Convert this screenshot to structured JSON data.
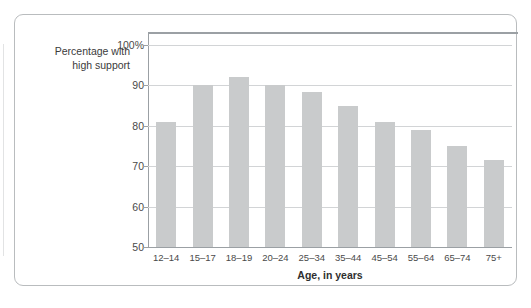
{
  "chart_data": {
    "type": "bar",
    "title": "",
    "subtitle": "",
    "xlabel": "Age, in years",
    "ylabel": "Percentage with high support",
    "ylabel_line1": "Percentage with",
    "ylabel_line2": "high support",
    "categories": [
      "12–14",
      "15–17",
      "18–19",
      "20–24",
      "25–34",
      "35–44",
      "45–54",
      "55–64",
      "65–74",
      "75+"
    ],
    "values": [
      81,
      90,
      92,
      90,
      88.5,
      85,
      81,
      79,
      75,
      71.5
    ],
    "series": [
      {
        "name": "Percentage with high support",
        "values": [
          81,
          90,
          92,
          90,
          88.5,
          85,
          81,
          79,
          75,
          71.5
        ]
      }
    ],
    "ylim": [
      50,
      103
    ],
    "yticks": [
      50,
      60,
      70,
      80,
      90,
      100
    ],
    "ytick_labels": [
      "50",
      "60",
      "70",
      "80",
      "90",
      "100%"
    ],
    "grid": true,
    "legend": false,
    "legend_position": "none",
    "bar_color": "#c9cbcc",
    "gridline_color": "#d2d4d6",
    "axis_color": "#9ba0a4",
    "frame_color": "#b9bcbe",
    "background_color": "#ffffff",
    "text_color": "#4a4a4a"
  }
}
